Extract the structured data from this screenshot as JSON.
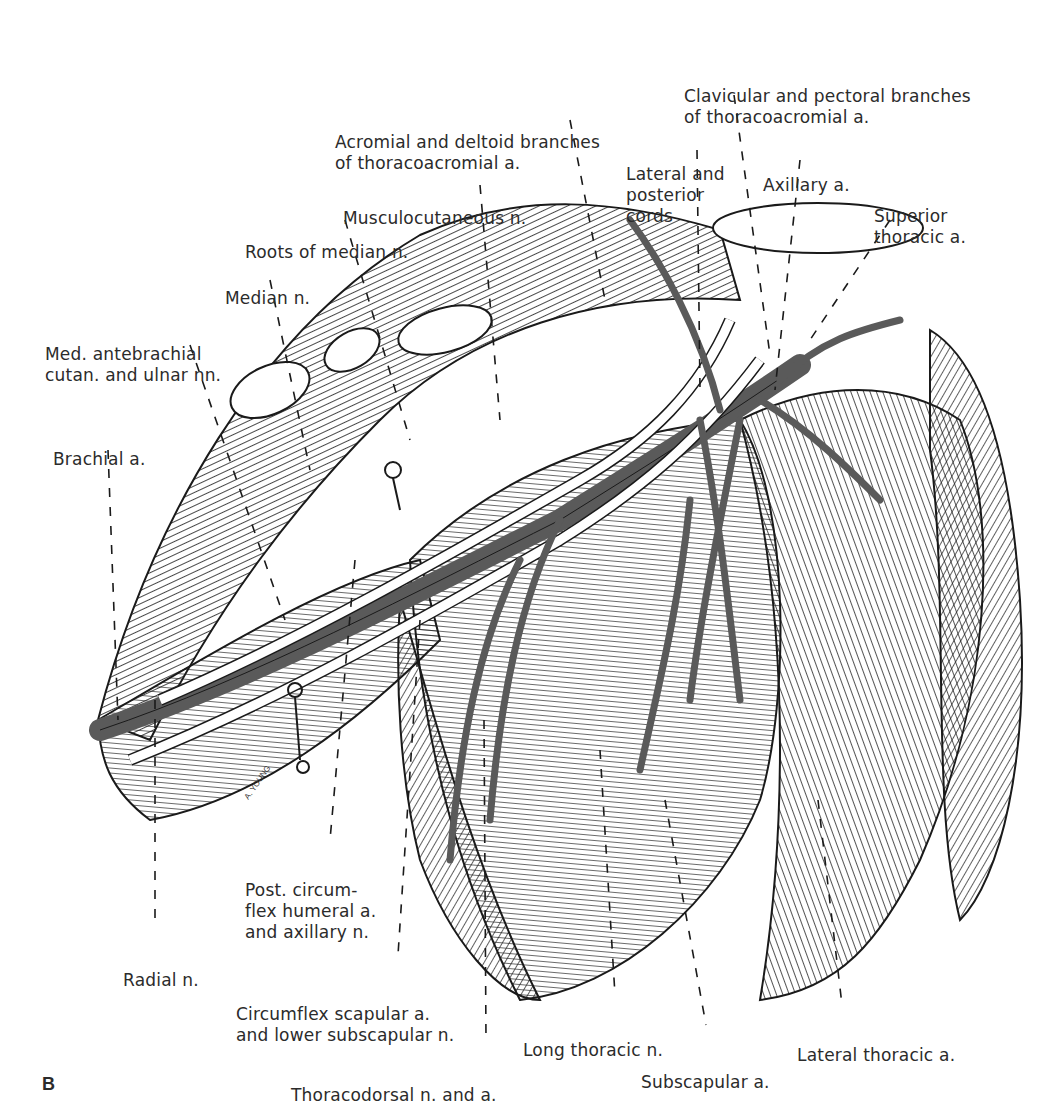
{
  "figure": {
    "panel_letter": "B",
    "signature": "A. YOUNG",
    "colors": {
      "artery": "#5a5a5a",
      "nerve": "#ffffff",
      "outline": "#1a1a1a",
      "background": "#ffffff"
    },
    "labels": [
      {
        "id": "clavicular-pectoral",
        "lines": [
          "Clavicular and pectoral branches",
          "of thoracoacromial a."
        ]
      },
      {
        "id": "acromial-deltoid",
        "lines": [
          "Acromial and deltoid branches",
          "of thoracoacromial a."
        ]
      },
      {
        "id": "lateral-posterior-cords",
        "lines": [
          "Lateral and",
          "posterior",
          "cords"
        ]
      },
      {
        "id": "axillary-a",
        "lines": [
          "Axillary a."
        ]
      },
      {
        "id": "superior-thoracic",
        "lines": [
          "Superior",
          "thoracic a."
        ]
      },
      {
        "id": "musculocutaneous",
        "lines": [
          "Musculocutaneous n."
        ]
      },
      {
        "id": "roots-median",
        "lines": [
          "Roots of median n."
        ]
      },
      {
        "id": "median",
        "lines": [
          "Median n."
        ]
      },
      {
        "id": "med-antebrachial",
        "lines": [
          "Med. antebrachial",
          "cutan. and ulnar nn."
        ]
      },
      {
        "id": "brachial-a",
        "lines": [
          "Brachial a."
        ]
      },
      {
        "id": "post-circumflex",
        "lines": [
          "Post. circum-",
          "flex humeral a.",
          "and axillary n."
        ]
      },
      {
        "id": "radial",
        "lines": [
          "Radial n."
        ]
      },
      {
        "id": "circumflex-scapular",
        "lines": [
          "Circumflex scapular a.",
          "and lower subscapular n."
        ]
      },
      {
        "id": "thoracodorsal",
        "lines": [
          "Thoracodorsal n. and a."
        ]
      },
      {
        "id": "long-thoracic",
        "lines": [
          "Long thoracic n."
        ]
      },
      {
        "id": "subscapular-a",
        "lines": [
          "Subscapular a."
        ]
      },
      {
        "id": "lateral-thoracic",
        "lines": [
          "Lateral thoracic a."
        ]
      }
    ]
  }
}
